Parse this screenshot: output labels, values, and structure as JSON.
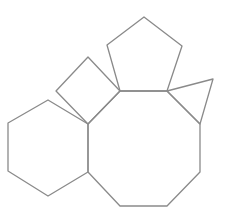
{
  "diagram": {
    "width": 225,
    "height": 219,
    "background": "#ffffff",
    "stroke_color": "#8a8a8a",
    "stroke_width": 1.3,
    "shapes": [
      {
        "name": "octagon",
        "sides": 8,
        "points": "120,91 167,91 200,124 200,172 167,206 120,206 88,172 88,124"
      },
      {
        "name": "pentagon",
        "sides": 5,
        "points": "120,91 107,45 144,17 182,46 167,91"
      },
      {
        "name": "square",
        "sides": 4,
        "points": "88,124 56,91 88,57 120,91"
      },
      {
        "name": "hexagon",
        "sides": 6,
        "points": "88,124 48,100 8,123 8,171 48,196 88,172"
      },
      {
        "name": "triangle",
        "sides": 3,
        "points": "167,91 213,79 200,124"
      }
    ]
  }
}
